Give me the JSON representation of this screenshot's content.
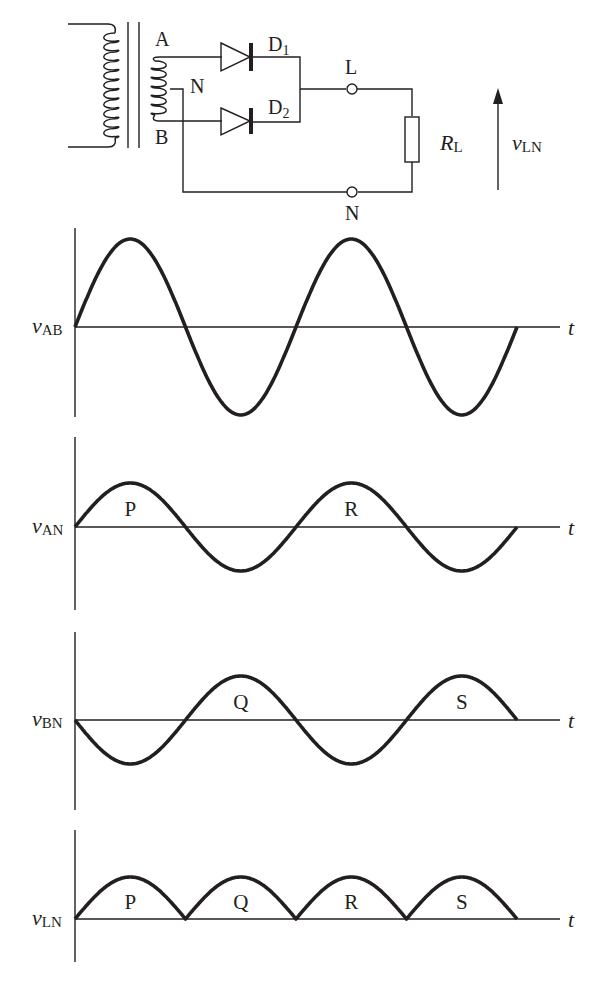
{
  "circuit": {
    "title": "Full-wave centre-tapped rectifier",
    "transformer": {
      "secondary_top_label": "A",
      "secondary_bottom_label": "B",
      "center_tap_label": "N"
    },
    "diodes": [
      {
        "label": "D",
        "sub": "1"
      },
      {
        "label": "D",
        "sub": "2"
      }
    ],
    "terminals": {
      "top": "L",
      "bottom": "N"
    },
    "load": {
      "label": "R",
      "sub": "L"
    },
    "output_voltage": {
      "label": "v",
      "sub": "LN"
    }
  },
  "chart_data": [
    {
      "type": "line",
      "title": "",
      "ylabel": "vAB",
      "ylabel_main": "v",
      "ylabel_sub": "AB",
      "xlabel": "t",
      "description": "Full sine wave across whole secondary, 2 cycles, large amplitude",
      "x": [
        0,
        0.25,
        0.5,
        0.75,
        1.0,
        1.25,
        1.5,
        1.75,
        2.0
      ],
      "values": [
        0,
        2,
        0,
        -2,
        0,
        2,
        0,
        -2,
        0
      ],
      "amplitude": 2,
      "cycles": 2,
      "region_labels": []
    },
    {
      "type": "line",
      "ylabel": "vAN",
      "ylabel_main": "v",
      "ylabel_sub": "AN",
      "xlabel": "t",
      "description": "Half-secondary voltage A to N, in phase with vAB, half amplitude",
      "x": [
        0,
        0.25,
        0.5,
        0.75,
        1.0,
        1.25,
        1.5,
        1.75,
        2.0
      ],
      "values": [
        0,
        1,
        0,
        -1,
        0,
        1,
        0,
        -1,
        0
      ],
      "amplitude": 1,
      "cycles": 2,
      "region_labels": [
        {
          "text": "P",
          "half_cycle": 1
        },
        {
          "text": "R",
          "half_cycle": 3
        }
      ]
    },
    {
      "type": "line",
      "ylabel": "vBN",
      "ylabel_main": "v",
      "ylabel_sub": "BN",
      "xlabel": "t",
      "description": "Half-secondary voltage B to N, inverted relative to vAN",
      "x": [
        0,
        0.25,
        0.5,
        0.75,
        1.0,
        1.25,
        1.5,
        1.75,
        2.0
      ],
      "values": [
        0,
        -1,
        0,
        1,
        0,
        -1,
        0,
        1,
        0
      ],
      "amplitude": 1,
      "cycles": 2,
      "region_labels": [
        {
          "text": "Q",
          "half_cycle": 2
        },
        {
          "text": "S",
          "half_cycle": 4
        }
      ]
    },
    {
      "type": "line",
      "ylabel": "vLN",
      "ylabel_main": "v",
      "ylabel_sub": "LN",
      "xlabel": "t",
      "description": "Full-wave rectified output across load",
      "x": [
        0,
        0.25,
        0.5,
        0.75,
        1.0,
        1.25,
        1.5,
        1.75,
        2.0
      ],
      "values": [
        0,
        1,
        0,
        1,
        0,
        1,
        0,
        1,
        0
      ],
      "amplitude": 1,
      "cycles": 2,
      "region_labels": [
        {
          "text": "P",
          "half_cycle": 1
        },
        {
          "text": "Q",
          "half_cycle": 2
        },
        {
          "text": "R",
          "half_cycle": 3
        },
        {
          "text": "S",
          "half_cycle": 4
        }
      ]
    }
  ]
}
